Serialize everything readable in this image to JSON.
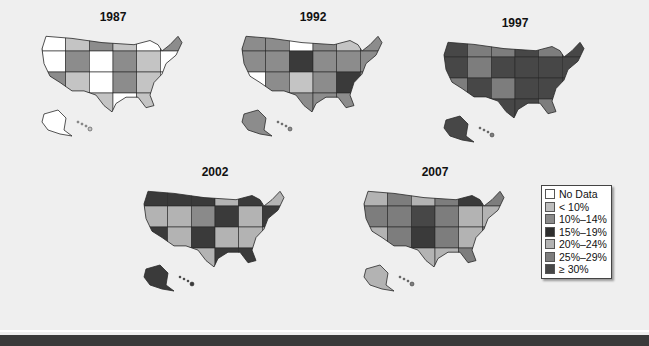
{
  "figure": {
    "type": "choropleth-map-series",
    "palette": {
      "nodata": "#ffffff",
      "lt10": "#bdbdbd",
      "10_14": "#8a8a8a",
      "15_19": "#3a3a3a",
      "20_24": "#b3b3b3",
      "25_29": "#7d7d7d",
      "ge30": "#474747",
      "border": "#2a2a2a"
    },
    "maps": [
      {
        "year": "1987",
        "dominant": [
          "lt10",
          "nodata",
          "10_14"
        ],
        "fills": [
          "#ffffff",
          "#c4c4c4",
          "#8c8c8c",
          "#c4c4c4",
          "#ffffff",
          "#8c8c8c",
          "#c4c4c4",
          "#ffffff",
          "#8c8c8c",
          "#ffffff",
          "#8c8c8c",
          "#c4c4c4"
        ]
      },
      {
        "year": "1992",
        "dominant": [
          "10_14",
          "15_19"
        ],
        "fills": [
          "#8c8c8c",
          "#8c8c8c",
          "#ffffff",
          "#8c8c8c",
          "#c4c4c4",
          "#8c8c8c",
          "#3a3a3a",
          "#8c8c8c",
          "#8c8c8c",
          "#3a3a3a",
          "#8c8c8c",
          "#8c8c8c"
        ]
      },
      {
        "year": "1997",
        "dominant": [
          "ge30",
          "25_29"
        ],
        "fills": [
          "#474747",
          "#7d7d7d",
          "#7d7d7d",
          "#474747",
          "#7d7d7d",
          "#474747",
          "#474747",
          "#474747",
          "#7d7d7d",
          "#474747",
          "#474747",
          "#474747"
        ]
      },
      {
        "year": "2002",
        "dominant": [
          "20_24",
          "15_19"
        ],
        "fills": [
          "#3a3a3a",
          "#3a3a3a",
          "#3a3a3a",
          "#b3b3b3",
          "#3a3a3a",
          "#b3b3b3",
          "#b3b3b3",
          "#b3b3b3",
          "#b3b3b3",
          "#8a8a8a",
          "#3a3a3a",
          "#b3b3b3"
        ]
      },
      {
        "year": "2007",
        "dominant": [
          "25_29",
          "20_24"
        ],
        "fills": [
          "#b3b3b3",
          "#7d7d7d",
          "#b3b3b3",
          "#7d7d7d",
          "#3a3a3a",
          "#7d7d7d",
          "#b3b3b3",
          "#7d7d7d",
          "#7d7d7d",
          "#474747",
          "#7d7d7d",
          "#b3b3b3"
        ]
      }
    ],
    "legend": [
      {
        "label": "No Data",
        "color": "#ffffff"
      },
      {
        "label": "< 10%",
        "color": "#bdbdbd"
      },
      {
        "label": "10%–14%",
        "color": "#8a8a8a"
      },
      {
        "label": "15%–19%",
        "color": "#2e2e2e"
      },
      {
        "label": "20%–24%",
        "color": "#b3b3b3"
      },
      {
        "label": "25%–29%",
        "color": "#7d7d7d"
      },
      {
        "label": "≥ 30%",
        "color": "#474747"
      }
    ]
  }
}
